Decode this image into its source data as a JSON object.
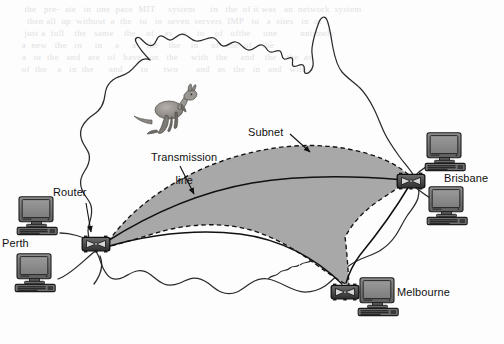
{
  "figure": {
    "kind": "network-topology-map",
    "region": "Australia"
  },
  "colors": {
    "subnet_fill": "#a8a8a8",
    "subnet_border": "#1a1a1a",
    "coastline": "#2b2b2b",
    "transmission_line": "#111111",
    "router_body": "#4a4a4a",
    "router_dark": "#1c1c1c",
    "screen_fill": "#8c8c8c",
    "computer_case": "#6e6e6e",
    "label_text": "#111111",
    "page_background": "#ffffff"
  },
  "annotations": [
    {
      "id": "transmission-line",
      "text_line1": "Transmission",
      "text_line2": "line",
      "x": 141,
      "y": 141
    },
    {
      "id": "subnet",
      "text": "Subnet",
      "x": 248,
      "y": 128
    },
    {
      "id": "router",
      "text": "Router",
      "x": 53,
      "y": 188
    }
  ],
  "sites": [
    {
      "id": "perth",
      "label": "Perth",
      "label_x": 2,
      "label_y": 239,
      "router_x": 96,
      "router_y": 244,
      "hosts": 2
    },
    {
      "id": "brisbane",
      "label": "Brisbane",
      "label_x": 444,
      "label_y": 174,
      "router_x": 411,
      "router_y": 180,
      "hosts": 2
    },
    {
      "id": "melbourne",
      "label": "Melbourne",
      "label_x": 397,
      "label_y": 288,
      "router_x": 345,
      "router_y": 291,
      "hosts": 1
    }
  ],
  "links": [
    {
      "from": "perth",
      "to": "brisbane",
      "type": "transmission-line"
    },
    {
      "from": "perth",
      "to": "melbourne",
      "type": "transmission-line"
    },
    {
      "from": "brisbane",
      "to": "melbourne",
      "type": "transmission-line"
    }
  ],
  "illustration": {
    "id": "kangaroo",
    "x": 152,
    "y": 92
  },
  "background_text": {
    "note": "faint scanner bleed-through from reverse page, illegible",
    "lines": [
      "        the   pre-  ate   in  one  pace  MIT     system      in   the  of it was   an  network  system",
      "         then all  up  without  a  the   to   in  seven  servers  IMP   to   a  sites   in  of",
      "        just a  full    the   same    the    of    as    a    to    of   ofthe     one         untimely",
      "       a  new   the   in     in     a     a    the    the    in     of   the  of    the",
      "       a   or  the   and   are   of   have   on   the     with   the     and    the    the  as",
      "       of  the    a   in  the      and       to      two       and   as   the   in   and   with"
    ]
  }
}
